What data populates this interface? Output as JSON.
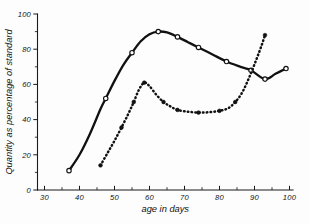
{
  "chart_data": {
    "type": "line",
    "title": "",
    "subtitle": "",
    "xlabel": "age in days",
    "ylabel": "Quantity as percentage of standard",
    "xlim": [
      28,
      101
    ],
    "ylim": [
      0,
      100
    ],
    "grid": false,
    "legend": "none",
    "x_ticks_major": [
      30,
      40,
      50,
      60,
      70,
      80,
      90,
      100
    ],
    "x_ticks_major_labels": [
      "30",
      "40",
      "50",
      "60",
      "70",
      "80",
      "90",
      "100"
    ],
    "x_ticks_minor": [
      35,
      45,
      55,
      65,
      75,
      85,
      95
    ],
    "y_ticks_major": [
      0,
      20,
      40,
      60,
      80,
      100
    ],
    "y_ticks_major_labels": [
      "0",
      "20",
      "40",
      "60",
      "80",
      "100"
    ],
    "y_ticks_minor": [
      10,
      30,
      50,
      70,
      90
    ],
    "series": [
      {
        "name": "solid-open-circle-curve",
        "style": "solid",
        "marker": "open-circle",
        "color": "#111111",
        "points": [
          [
            37.0,
            11.0
          ],
          [
            40.0,
            20.0
          ],
          [
            43.0,
            32.0
          ],
          [
            46.0,
            46.0
          ],
          [
            47.5,
            52.0
          ],
          [
            50.0,
            62.0
          ],
          [
            52.5,
            71.0
          ],
          [
            55.0,
            78.0
          ],
          [
            57.5,
            84.5
          ],
          [
            60.0,
            88.5
          ],
          [
            62.5,
            90.0
          ],
          [
            65.0,
            89.5
          ],
          [
            68.0,
            87.0
          ],
          [
            71.0,
            84.0
          ],
          [
            74.0,
            81.0
          ],
          [
            78.0,
            77.0
          ],
          [
            82.0,
            73.0
          ],
          [
            86.0,
            70.0
          ],
          [
            89.0,
            68.0
          ],
          [
            93.0,
            63.0
          ],
          [
            96.0,
            66.0
          ],
          [
            99.0,
            69.0
          ]
        ],
        "marker_points": [
          [
            37.0,
            11.0
          ],
          [
            47.5,
            52.0
          ],
          [
            55.0,
            78.0
          ],
          [
            62.5,
            90.0
          ],
          [
            68.0,
            87.0
          ],
          [
            74.0,
            81.0
          ],
          [
            82.0,
            73.0
          ],
          [
            89.0,
            68.0
          ],
          [
            93.0,
            63.0
          ],
          [
            99.0,
            69.0
          ]
        ]
      },
      {
        "name": "dotted-filled-circle-curve",
        "style": "dotted",
        "marker": "filled-circle",
        "color": "#111111",
        "points": [
          [
            46.0,
            14.0
          ],
          [
            48.0,
            21.0
          ],
          [
            50.0,
            28.0
          ],
          [
            52.0,
            35.5
          ],
          [
            54.0,
            43.5
          ],
          [
            55.5,
            50.0
          ],
          [
            57.0,
            57.0
          ],
          [
            58.5,
            61.0
          ],
          [
            60.0,
            59.0
          ],
          [
            62.0,
            54.0
          ],
          [
            64.0,
            50.0
          ],
          [
            66.0,
            47.5
          ],
          [
            68.0,
            45.5
          ],
          [
            71.0,
            44.5
          ],
          [
            74.0,
            44.0
          ],
          [
            77.0,
            44.2
          ],
          [
            80.0,
            45.0
          ],
          [
            82.5,
            46.5
          ],
          [
            84.5,
            50.0
          ],
          [
            86.5,
            55.5
          ],
          [
            88.5,
            64.0
          ],
          [
            90.5,
            74.0
          ],
          [
            92.0,
            82.0
          ],
          [
            93.0,
            88.0
          ]
        ],
        "marker_points": [
          [
            46.0,
            14.0
          ],
          [
            52.0,
            35.5
          ],
          [
            55.5,
            50.0
          ],
          [
            58.5,
            61.0
          ],
          [
            64.0,
            50.0
          ],
          [
            68.0,
            45.5
          ],
          [
            74.0,
            44.0
          ],
          [
            80.0,
            45.0
          ],
          [
            84.5,
            50.0
          ],
          [
            93.0,
            88.0
          ]
        ]
      }
    ]
  }
}
